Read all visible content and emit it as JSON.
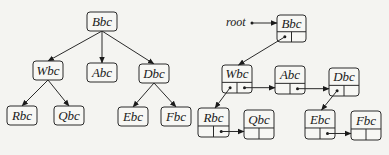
{
  "diagram": {
    "left_tree": {
      "title": "general tree",
      "root": "Bbc",
      "nodes": [
        {
          "id": "Bbc",
          "label": "Bbc",
          "x": 87,
          "y": 12,
          "w": 30,
          "h": 19
        },
        {
          "id": "Wbc",
          "label": "Wbc",
          "x": 33,
          "y": 61,
          "w": 30,
          "h": 19
        },
        {
          "id": "Abc",
          "label": "Abc",
          "x": 87,
          "y": 63,
          "w": 30,
          "h": 19
        },
        {
          "id": "Dbc",
          "label": "Dbc",
          "x": 139,
          "y": 64,
          "w": 30,
          "h": 19
        },
        {
          "id": "Rbc",
          "label": "Rbc",
          "x": 7,
          "y": 106,
          "w": 30,
          "h": 19
        },
        {
          "id": "Qbc",
          "label": "Qbc",
          "x": 54,
          "y": 106,
          "w": 30,
          "h": 19
        },
        {
          "id": "Ebc",
          "label": "Ebc",
          "x": 118,
          "y": 107,
          "w": 30,
          "h": 19
        },
        {
          "id": "Fbc",
          "label": "Fbc",
          "x": 161,
          "y": 107,
          "w": 30,
          "h": 19
        }
      ],
      "edges": [
        {
          "from": "Bbc",
          "to": "Wbc"
        },
        {
          "from": "Bbc",
          "to": "Abc"
        },
        {
          "from": "Bbc",
          "to": "Dbc"
        },
        {
          "from": "Wbc",
          "to": "Rbc"
        },
        {
          "from": "Wbc",
          "to": "Qbc"
        },
        {
          "from": "Dbc",
          "to": "Ebc"
        },
        {
          "from": "Dbc",
          "to": "Fbc"
        }
      ]
    },
    "right_tree": {
      "title": "first-child / next-sibling representation",
      "root_pointer_label": "root",
      "nodes": [
        {
          "id": "Bbc",
          "label": "Bbc",
          "x": 277,
          "y": 15,
          "w": 29,
          "h": 27
        },
        {
          "id": "Wbc",
          "label": "Wbc",
          "x": 222,
          "y": 65,
          "w": 30,
          "h": 28
        },
        {
          "id": "Abc",
          "label": "Abc",
          "x": 275,
          "y": 66,
          "w": 30,
          "h": 28
        },
        {
          "id": "Dbc",
          "label": "Dbc",
          "x": 329,
          "y": 68,
          "w": 30,
          "h": 28
        },
        {
          "id": "Rbc",
          "label": "Rbc",
          "x": 198,
          "y": 108,
          "w": 31,
          "h": 29
        },
        {
          "id": "Qbc",
          "label": "Qbc",
          "x": 244,
          "y": 110,
          "w": 30,
          "h": 29
        },
        {
          "id": "Ebc",
          "label": "Ebc",
          "x": 305,
          "y": 110,
          "w": 30,
          "h": 29
        },
        {
          "id": "Fbc",
          "label": "Fbc",
          "x": 351,
          "y": 111,
          "w": 30,
          "h": 29
        }
      ],
      "first_child_links": [
        {
          "from": "Bbc",
          "to": "Wbc"
        },
        {
          "from": "Wbc",
          "to": "Rbc"
        },
        {
          "from": "Dbc",
          "to": "Ebc"
        }
      ],
      "next_sibling_links": [
        {
          "from": "Wbc",
          "to": "Abc"
        },
        {
          "from": "Abc",
          "to": "Dbc"
        },
        {
          "from": "Rbc",
          "to": "Qbc"
        },
        {
          "from": "Ebc",
          "to": "Fbc"
        }
      ]
    }
  }
}
